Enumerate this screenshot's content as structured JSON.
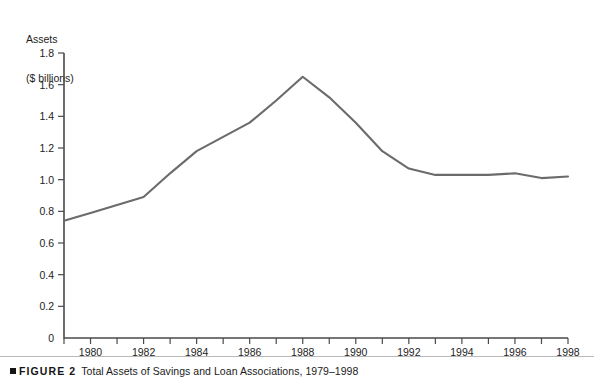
{
  "figure": {
    "marker_icon": "black-square-icon",
    "label": "FIGURE 2",
    "title": "Total Assets of Savings and Loan Associations, 1979–1998"
  },
  "axis_title": {
    "line1": "Assets",
    "line2": "($ billions)"
  },
  "chart_data": {
    "type": "line",
    "title": "Total Assets of Savings and Loan Associations, 1979–1998",
    "xlabel": "",
    "ylabel": "Assets ($ billions)",
    "xlim": [
      1979,
      1998
    ],
    "ylim": [
      0,
      1.8
    ],
    "grid": false,
    "legend": null,
    "y_ticks": [
      "0",
      "0.2",
      "0.4",
      "0.6",
      "0.8",
      "1.0",
      "1.2",
      "1.4",
      "1.6",
      "1.8"
    ],
    "y_tick_values": [
      0,
      0.2,
      0.4,
      0.6,
      0.8,
      1.0,
      1.2,
      1.4,
      1.6,
      1.8
    ],
    "x_ticks": [
      "1980",
      "1982",
      "1984",
      "1986",
      "1988",
      "1990",
      "1992",
      "1994",
      "1996",
      "1998"
    ],
    "x_tick_values": [
      1980,
      1982,
      1984,
      1986,
      1988,
      1990,
      1992,
      1994,
      1996,
      1998
    ],
    "x_minor_tick_values": [
      1979,
      1981,
      1983,
      1985,
      1987,
      1989,
      1991,
      1993,
      1995,
      1997
    ],
    "series": [
      {
        "name": "Total assets",
        "color": "#6b6b6b",
        "x": [
          1979,
          1980,
          1981,
          1982,
          1983,
          1984,
          1985,
          1986,
          1987,
          1988,
          1989,
          1990,
          1991,
          1992,
          1993,
          1994,
          1995,
          1996,
          1997,
          1998
        ],
        "values": [
          0.74,
          0.79,
          0.84,
          0.89,
          1.04,
          1.18,
          1.27,
          1.36,
          1.5,
          1.65,
          1.52,
          1.36,
          1.18,
          1.07,
          1.03,
          1.03,
          1.03,
          1.04,
          1.01,
          1.02
        ]
      }
    ]
  },
  "colors": {
    "line": "#6b6b6b",
    "axis": "#4a4a4a",
    "text": "#1a1a1a",
    "rule": "#b9b9b9",
    "background": "#ffffff"
  }
}
